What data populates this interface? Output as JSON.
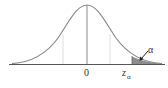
{
  "diagram": {
    "type": "standard-normal-distribution",
    "labels": {
      "center": "0",
      "critical_main": "z",
      "critical_sub": "α",
      "tail_area": "α"
    },
    "colors": {
      "curve": "#8a8a8a",
      "axis": "#555555",
      "center_line": "#8a8a8a",
      "guide_lines": "#d0d0d0",
      "shaded_tail": "#8c8c8c",
      "text": "#333333"
    }
  }
}
